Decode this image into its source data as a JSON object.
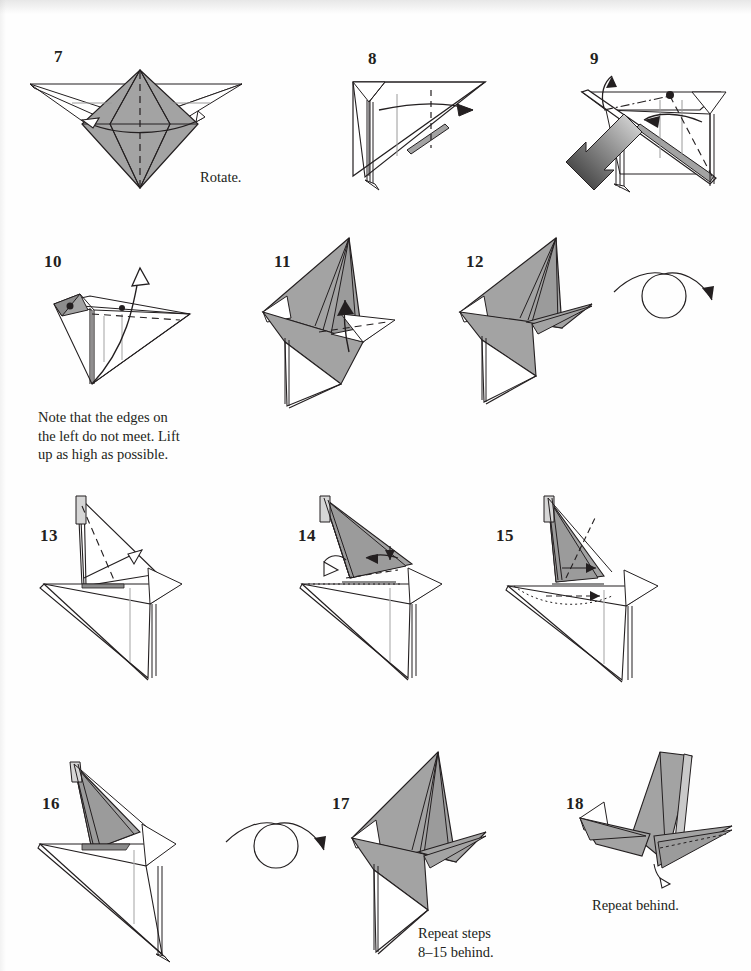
{
  "document": {
    "kind": "origami-folding-instructions",
    "page_background": "#fefefe",
    "ink_color": "#231f20",
    "paper_gray": "#a3a3a3",
    "paper_gray_dark": "#8c8c8c",
    "paper_gray_light": "#c9c9c9"
  },
  "steps": [
    {
      "id": "step-7",
      "number": "7"
    },
    {
      "id": "step-8",
      "number": "8"
    },
    {
      "id": "step-9",
      "number": "9"
    },
    {
      "id": "step-10",
      "number": "10"
    },
    {
      "id": "step-11",
      "number": "11"
    },
    {
      "id": "step-12",
      "number": "12"
    },
    {
      "id": "step-13",
      "number": "13"
    },
    {
      "id": "step-14",
      "number": "14"
    },
    {
      "id": "step-15",
      "number": "15"
    },
    {
      "id": "step-16",
      "number": "16"
    },
    {
      "id": "step-17",
      "number": "17"
    },
    {
      "id": "step-18",
      "number": "18"
    }
  ],
  "captions": {
    "rotate": "Rotate.",
    "note_step10": "Note that the edges on\nthe left do not meet. Lift\nup as high as possible.",
    "repeat_8_15_behind": "Repeat steps\n8–15 behind.",
    "repeat_behind": "Repeat behind."
  },
  "symbols": {
    "turn_over_1": "turn-over-symbol",
    "turn_over_2": "turn-over-symbol",
    "push_arrow_step9": "push-in-arrow",
    "valley_fold": "dashed-line",
    "mountain_fold": "dash-dot-line",
    "hidden_edge": "dotted-line"
  }
}
